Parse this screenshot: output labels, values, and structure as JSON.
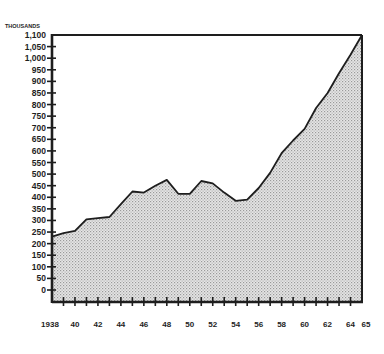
{
  "chart_data": {
    "type": "area",
    "title": "",
    "unit_label": "THOUSANDS",
    "xlabel": "",
    "ylabel": "THOUSANDS",
    "ylim": [
      0,
      1100
    ],
    "xlim": [
      1938,
      1965
    ],
    "grid": false,
    "legend": null,
    "y_ticks": [
      0,
      50,
      100,
      150,
      200,
      250,
      300,
      350,
      400,
      450,
      500,
      550,
      600,
      650,
      700,
      750,
      800,
      850,
      900,
      950,
      1000,
      1050,
      1100
    ],
    "y_tick_labels": [
      "0",
      "50",
      "100",
      "150",
      "200",
      "250",
      "300",
      "350",
      "400",
      "450",
      "500",
      "550",
      "600",
      "650",
      "700",
      "750",
      "800",
      "850",
      "900",
      "950",
      "1,000",
      "1,050",
      "1,100"
    ],
    "x_tick_labels": [
      {
        "year": 1938,
        "label": "1938"
      },
      {
        "year": 1940,
        "label": "40"
      },
      {
        "year": 1942,
        "label": "42"
      },
      {
        "year": 1944,
        "label": "44"
      },
      {
        "year": 1946,
        "label": "46"
      },
      {
        "year": 1948,
        "label": "48"
      },
      {
        "year": 1950,
        "label": "50"
      },
      {
        "year": 1952,
        "label": "52"
      },
      {
        "year": 1954,
        "label": "54"
      },
      {
        "year": 1956,
        "label": "56"
      },
      {
        "year": 1958,
        "label": "58"
      },
      {
        "year": 1960,
        "label": "60"
      },
      {
        "year": 1962,
        "label": "62"
      },
      {
        "year": 1964,
        "label": "64"
      },
      {
        "year": 1965,
        "label": "65"
      }
    ],
    "x": [
      1938,
      1939,
      1940,
      1941,
      1942,
      1943,
      1944,
      1945,
      1946,
      1947,
      1948,
      1949,
      1950,
      1951,
      1952,
      1953,
      1954,
      1955,
      1956,
      1957,
      1958,
      1959,
      1960,
      1961,
      1962,
      1963,
      1964,
      1965
    ],
    "series": [
      {
        "name": "Total",
        "values": [
          230,
          245,
          255,
          305,
          310,
          315,
          370,
          425,
          420,
          450,
          475,
          415,
          415,
          470,
          460,
          420,
          385,
          390,
          440,
          505,
          590,
          645,
          695,
          785,
          850,
          935,
          1015,
          1100
        ]
      }
    ]
  },
  "style": {
    "line_color": "#1e1e1e",
    "fill_color": "#d4d4d4",
    "axis_color": "#1e1e1e",
    "background": "#ffffff"
  }
}
